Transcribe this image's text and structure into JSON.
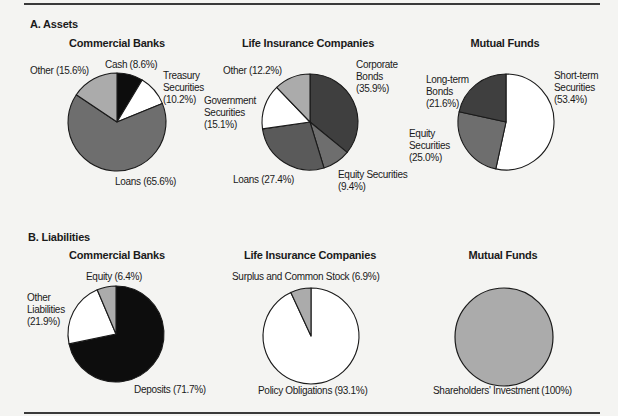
{
  "sections": {
    "assets": {
      "title": "A. Assets"
    },
    "liabilities": {
      "title": "B. Liabilities"
    }
  },
  "colors": {
    "black": "#0d0d0d",
    "dark_gray": "#3f3f3f",
    "mid_gray": "#6e6e6e",
    "light_gray": "#ababab",
    "white": "#ffffff",
    "outline": "#1a1a1a"
  },
  "chart_data": [
    {
      "type": "pie",
      "section": "A. Assets",
      "title": "Commercial Banks",
      "slices": [
        {
          "label": "Cash",
          "value": 8.6,
          "color": "#0d0d0d"
        },
        {
          "label": "Treasury Securities",
          "value": 10.2,
          "color": "#ffffff"
        },
        {
          "label": "Loans",
          "value": 65.6,
          "color": "#6e6e6e"
        },
        {
          "label": "Other",
          "value": 15.6,
          "color": "#ababab"
        }
      ]
    },
    {
      "type": "pie",
      "section": "A. Assets",
      "title": "Life Insurance Companies",
      "slices": [
        {
          "label": "Corporate Bonds",
          "value": 35.9,
          "color": "#3f3f3f"
        },
        {
          "label": "Equity Securities",
          "value": 9.4,
          "color": "#6e6e6e"
        },
        {
          "label": "Loans",
          "value": 27.4,
          "color": "#5a5a5a"
        },
        {
          "label": "Government Securities",
          "value": 15.1,
          "color": "#ffffff"
        },
        {
          "label": "Other",
          "value": 12.2,
          "color": "#ababab"
        }
      ]
    },
    {
      "type": "pie",
      "section": "A. Assets",
      "title": "Mutual Funds",
      "slices": [
        {
          "label": "Short-term Securities",
          "value": 53.4,
          "color": "#ffffff"
        },
        {
          "label": "Equity Securities",
          "value": 25.0,
          "color": "#6e6e6e"
        },
        {
          "label": "Long-term Bonds",
          "value": 21.6,
          "color": "#3f3f3f"
        }
      ]
    },
    {
      "type": "pie",
      "section": "B. Liabilities",
      "title": "Commercial Banks",
      "slices": [
        {
          "label": "Deposits",
          "value": 71.7,
          "color": "#0d0d0d"
        },
        {
          "label": "Other Liabilities",
          "value": 21.9,
          "color": "#ffffff"
        },
        {
          "label": "Equity",
          "value": 6.4,
          "color": "#ababab"
        }
      ]
    },
    {
      "type": "pie",
      "section": "B. Liabilities",
      "title": "Life Insurance Companies",
      "slices": [
        {
          "label": "Policy Obligations",
          "value": 93.1,
          "color": "#ffffff"
        },
        {
          "label": "Surplus and Common Stock",
          "value": 6.9,
          "color": "#ababab"
        }
      ]
    },
    {
      "type": "pie",
      "section": "B. Liabilities",
      "title": "Mutual Funds",
      "slices": [
        {
          "label": "Shareholders' Investment",
          "value": 100,
          "color": "#ababab"
        }
      ]
    }
  ],
  "labels": {
    "a_cb": {
      "title": "Commercial Banks",
      "other": "Other (15.6%)",
      "cash": "Cash (8.6%)",
      "treasury_1": "Treasury",
      "treasury_2": "Securities",
      "treasury_3": "(10.2%)",
      "loans": "Loans (65.6%)"
    },
    "a_lic": {
      "title": "Life Insurance Companies",
      "other": "Other (12.2%)",
      "corp_1": "Corporate",
      "corp_2": "Bonds",
      "corp_3": "(35.9%)",
      "gov_1": "Government",
      "gov_2": "Securities",
      "gov_3": "(15.1%)",
      "loans": "Loans (27.4%)",
      "equity_1": "Equity Securities",
      "equity_2": "(9.4%)"
    },
    "a_mf": {
      "title": "Mutual Funds",
      "ltb_1": "Long-term",
      "ltb_2": "Bonds",
      "ltb_3": "(21.6%)",
      "sts_1": "Short-term",
      "sts_2": "Securities",
      "sts_3": "(53.4%)",
      "eq_1": "Equity",
      "eq_2": "Securities",
      "eq_3": "(25.0%)"
    },
    "b_cb": {
      "title": "Commercial Banks",
      "equity": "Equity (6.4%)",
      "other_1": "Other",
      "other_2": "Liabilities",
      "other_3": "(21.9%)",
      "deposits": "Deposits (71.7%)"
    },
    "b_lic": {
      "title": "Life Insurance Companies",
      "surplus": "Surplus and Common Stock (6.9%)",
      "policy": "Policy Obligations (93.1%)"
    },
    "b_mf": {
      "title": "Mutual Funds",
      "shareholders": "Shareholders' Investment (100%)"
    }
  }
}
